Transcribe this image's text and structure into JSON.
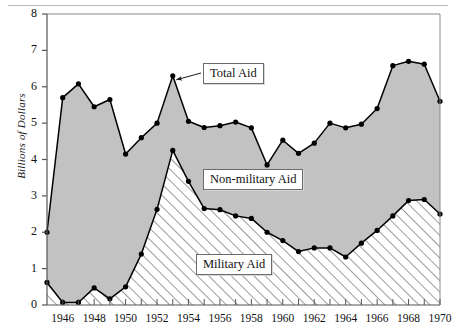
{
  "chart_data": {
    "type": "area",
    "title": "",
    "subtitle": "",
    "xlabel": "",
    "ylabel": "Billions of Dollars",
    "xlim": [
      1945,
      1970
    ],
    "ylim": [
      0,
      8
    ],
    "grid": false,
    "legend_position": "inline-callouts",
    "x": [
      1945,
      1946,
      1947,
      1948,
      1949,
      1950,
      1951,
      1952,
      1953,
      1954,
      1955,
      1956,
      1957,
      1958,
      1959,
      1960,
      1961,
      1962,
      1963,
      1964,
      1965,
      1966,
      1967,
      1968,
      1969,
      1970
    ],
    "xtick_labels": [
      "1946",
      "1948",
      "1950",
      "1952",
      "1954",
      "1956",
      "1958",
      "1960",
      "1962",
      "1964",
      "1966",
      "1968",
      "1970"
    ],
    "xtick_values": [
      1946,
      1948,
      1950,
      1952,
      1954,
      1956,
      1958,
      1960,
      1962,
      1964,
      1966,
      1968,
      1970
    ],
    "ytick_labels": [
      "0",
      "1",
      "2",
      "3",
      "4",
      "5",
      "6",
      "7",
      "8"
    ],
    "ytick_values": [
      0,
      1,
      2,
      3,
      4,
      5,
      6,
      7,
      8
    ],
    "series": [
      {
        "name": "Total Aid",
        "fill": "#c2c2c2",
        "values": [
          2.0,
          5.7,
          6.08,
          5.45,
          5.65,
          4.15,
          4.6,
          5.0,
          6.3,
          5.05,
          4.88,
          4.93,
          5.03,
          4.87,
          3.85,
          4.53,
          4.17,
          4.45,
          5.0,
          4.87,
          4.97,
          5.4,
          6.58,
          6.7,
          6.62,
          5.6
        ]
      },
      {
        "name": "Military Aid",
        "fill": "hatch-diagonal",
        "values": [
          0.62,
          0.07,
          0.07,
          0.47,
          0.17,
          0.5,
          1.4,
          2.63,
          4.25,
          3.4,
          2.65,
          2.62,
          2.45,
          2.38,
          2.0,
          1.77,
          1.47,
          1.57,
          1.57,
          1.32,
          1.7,
          2.05,
          2.45,
          2.87,
          2.9,
          2.5
        ]
      }
    ],
    "annotations": [
      {
        "id": "total-aid",
        "label": "Total Aid",
        "points_to_year": 1953,
        "points_to_value": 6.3
      },
      {
        "id": "non-military-aid",
        "label": "Non-military Aid"
      },
      {
        "id": "military-aid",
        "label": "Military Aid"
      }
    ],
    "colors": {
      "non_military_fill": "#c2c2c2",
      "military_hatch_line": "#4a4a4a",
      "line": "#000000",
      "marker": "#000000",
      "axis": "#555555",
      "background": "#ffffff"
    }
  },
  "axis": {
    "y_title": "Billions of Dollars"
  },
  "labels": {
    "total_aid": "Total Aid",
    "non_military_aid": "Non-military Aid",
    "military_aid": "Military Aid"
  }
}
